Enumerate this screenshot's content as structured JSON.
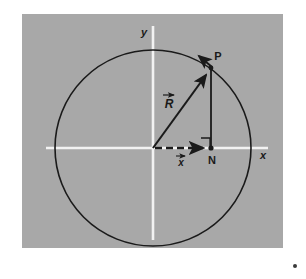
{
  "figure": {
    "panel": {
      "background_color": "#a8a8a8",
      "x": 22,
      "y": 14,
      "width": 261,
      "height": 234
    },
    "page_background_color": "#ffffff",
    "axes": {
      "color": "#f2f2f2",
      "x_axis_label": "x",
      "y_axis_label": "y",
      "origin": {
        "x": 153,
        "y": 148
      }
    },
    "circle": {
      "color": "#1a1a1a",
      "center_x": 153,
      "center_y": 148,
      "radius": 98,
      "stroke_width": 1.6
    },
    "points": [
      {
        "name": "P",
        "label": "P",
        "x": 211,
        "y": 68
      },
      {
        "name": "N",
        "label": "N",
        "x": 211,
        "y": 148
      }
    ],
    "vectors": [
      {
        "name": "R",
        "label": "R",
        "overbar_arrow": true,
        "style": "solid",
        "from": "origin",
        "to": "P",
        "label_x": 168,
        "label_y": 103
      },
      {
        "name": "x",
        "label": "x",
        "overbar_arrow": true,
        "style": "dashed",
        "from": "origin",
        "to": "N",
        "label_x": 180,
        "label_y": 163
      }
    ],
    "tangent_arrow": {
      "name": "tangent-at-P",
      "from_x": 211,
      "from_y": 68,
      "to_x": 197,
      "to_y": 54
    },
    "right_angle_marker": {
      "name": "right-angle-at-N",
      "x": 201,
      "y": 138,
      "size": 9
    },
    "corner_dot": {
      "name": "corner-dot",
      "x": 295,
      "y": 266,
      "radius": 2,
      "color": "#3a3a3a"
    }
  }
}
